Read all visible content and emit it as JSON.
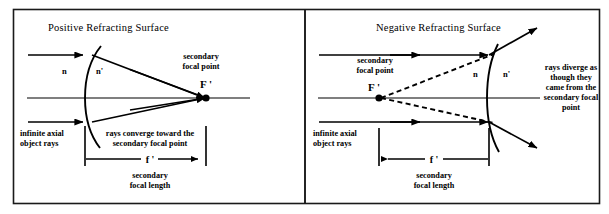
{
  "figure": {
    "name": "refracting-surface-diagram",
    "panels": [
      {
        "id": "positive",
        "title": "Positive Refracting Surface",
        "labels": {
          "index_left": "n",
          "index_right": "n'",
          "focal_point_caption_line1": "secondary",
          "focal_point_caption_line2": "focal point",
          "focal_point_symbol": "F '",
          "object_rays_line1": "infinite axial",
          "object_rays_line2": "object rays",
          "behavior_line1": "rays converge toward the",
          "behavior_line2": "secondary focal point",
          "focal_length_symbol": "f '",
          "focal_length_caption_line1": "secondary",
          "focal_length_caption_line2": "focal length"
        }
      },
      {
        "id": "negative",
        "title": "Negative Refracting Surface",
        "labels": {
          "index_left": "n",
          "index_right": "n'",
          "focal_point_caption_line1": "secondary",
          "focal_point_caption_line2": "focal point",
          "focal_point_symbol": "F '",
          "object_rays_line1": "infinite axial",
          "object_rays_line2": "object rays",
          "behavior_line1": "rays diverge as",
          "behavior_line2": "though they",
          "behavior_line3": "came from the",
          "behavior_line4": "secondary focal",
          "behavior_line5": "point",
          "focal_length_symbol": "f '",
          "focal_length_caption_line1": "secondary",
          "focal_length_caption_line2": "focal length"
        }
      }
    ],
    "colors": {
      "ink": "#000000",
      "frame": "#1a1a1a",
      "background": "#ffffff"
    }
  }
}
